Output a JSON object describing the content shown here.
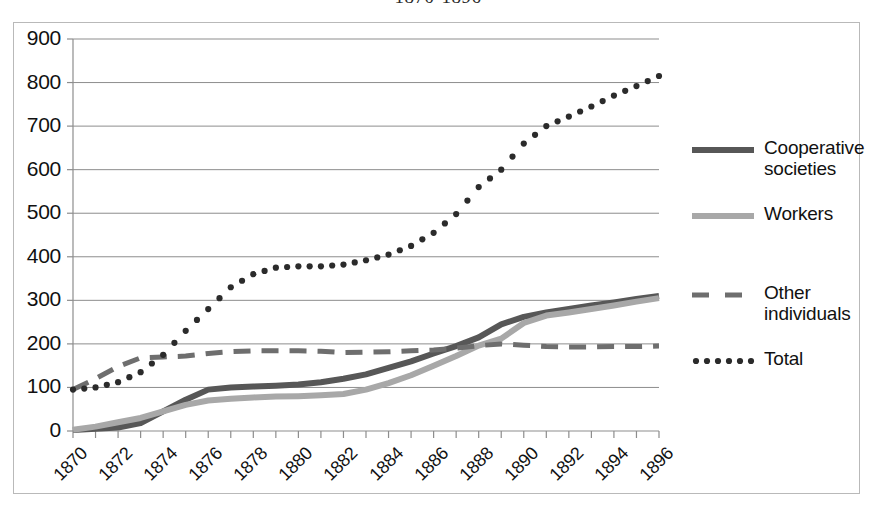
{
  "title": "1870-1896",
  "chart_data": {
    "type": "line",
    "title": "1870-1896",
    "xlabel": "",
    "ylabel": "",
    "ylim": [
      0,
      900
    ],
    "ytick_step": 100,
    "yticks": [
      "0",
      "100",
      "200",
      "300",
      "400",
      "500",
      "600",
      "700",
      "800",
      "900"
    ],
    "xlim": [
      1870,
      1896
    ],
    "xticks": [
      "1870",
      "1872",
      "1874",
      "1876",
      "1878",
      "1880",
      "1882",
      "1884",
      "1886",
      "1888",
      "1890",
      "1892",
      "1894",
      "1896"
    ],
    "xtick_step": 2,
    "grid": "horizontal",
    "legend_position": "right",
    "x": [
      1870,
      1871,
      1872,
      1873,
      1874,
      1875,
      1876,
      1877,
      1878,
      1879,
      1880,
      1881,
      1882,
      1883,
      1884,
      1885,
      1886,
      1887,
      1888,
      1889,
      1890,
      1891,
      1892,
      1893,
      1894,
      1895,
      1896
    ],
    "series": [
      {
        "name": "Cooperative societies",
        "style": "solid-thick",
        "color": "#575757",
        "values": [
          2,
          5,
          8,
          18,
          45,
          72,
          95,
          100,
          102,
          104,
          107,
          112,
          120,
          130,
          145,
          160,
          178,
          195,
          215,
          245,
          262,
          272,
          280,
          288,
          295,
          303,
          310
        ]
      },
      {
        "name": "Workers",
        "style": "solid-thick",
        "color": "#a8a8a8",
        "values": [
          3,
          10,
          20,
          30,
          45,
          60,
          70,
          74,
          77,
          79,
          80,
          82,
          85,
          95,
          110,
          128,
          150,
          172,
          196,
          212,
          248,
          265,
          272,
          280,
          288,
          297,
          305
        ]
      },
      {
        "name": "Other individuals",
        "style": "dashed",
        "color": "#6e6e6e",
        "values": [
          95,
          120,
          148,
          168,
          170,
          172,
          178,
          182,
          184,
          184,
          184,
          183,
          180,
          181,
          182,
          184,
          186,
          190,
          196,
          200,
          197,
          194,
          193,
          193,
          194,
          194,
          195
        ]
      },
      {
        "name": "Total",
        "style": "dotted",
        "color": "#2b2b2b",
        "values": [
          95,
          100,
          112,
          135,
          175,
          230,
          280,
          330,
          360,
          375,
          378,
          378,
          382,
          392,
          405,
          425,
          455,
          498,
          560,
          600,
          660,
          700,
          722,
          745,
          770,
          792,
          815
        ]
      }
    ]
  },
  "legend": {
    "items": [
      {
        "label_line1": "Cooperative",
        "label_line2": "societies",
        "style": "solid-thick",
        "color": "#575757"
      },
      {
        "label_line1": "Workers",
        "label_line2": "",
        "style": "solid-thick",
        "color": "#a8a8a8"
      },
      {
        "label_line1": "Other",
        "label_line2": "individuals",
        "style": "dashed",
        "color": "#6e6e6e"
      },
      {
        "label_line1": "Total",
        "label_line2": "",
        "style": "dotted",
        "color": "#2b2b2b"
      }
    ]
  }
}
